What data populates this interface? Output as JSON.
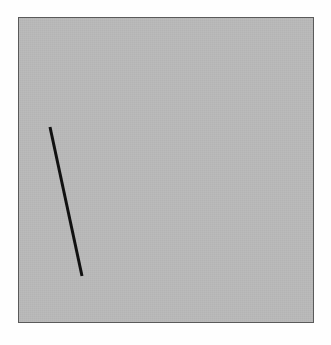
{
  "figure": {
    "canvas": {
      "width": 331,
      "height": 345,
      "background_color": "#fefefe"
    },
    "panel": {
      "label": "drawing panel",
      "x": 18,
      "y": 17,
      "width": 296,
      "height": 306,
      "fill_color": "#b9b9b9",
      "border_color": "#5a5a5a",
      "border_width": 1
    },
    "strokes": [
      {
        "id": "line-1",
        "label": "line segment",
        "shape": "line",
        "color": "#111111",
        "width": 3,
        "linecap": "butt",
        "x1": 50,
        "y1": 127,
        "x2": 82,
        "y2": 276
      }
    ]
  },
  "chart_data": {
    "type": "line",
    "subtitle": "",
    "xlabel": "",
    "ylabel": "",
    "grid": false,
    "legend": "none",
    "xlim": [
      18,
      314
    ],
    "ylim": [
      17,
      323
    ],
    "tick_labels_x": [],
    "tick_labels_y": [],
    "annotations": [],
    "series": [
      {
        "name": "line segment",
        "color": "#111111",
        "x": [
          50,
          82
        ],
        "y": [
          127,
          276
        ]
      }
    ]
  }
}
